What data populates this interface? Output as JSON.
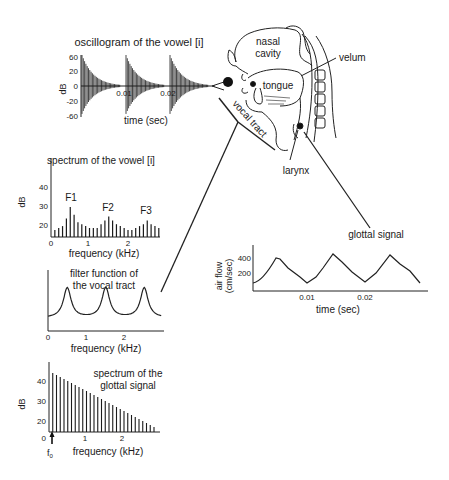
{
  "oscillogram": {
    "title": "oscillogram of the vowel [i]",
    "ylabel": "dB",
    "yticks": [
      "60",
      "20",
      "0",
      "-20",
      "-60"
    ],
    "xticks": [
      "0.01",
      "0.02"
    ],
    "xlabel": "time (sec)"
  },
  "anatomy": {
    "nasal_line1": "nasal",
    "nasal_line2": "cavity",
    "tongue": "tongue",
    "velum": "velum",
    "vocal_tract": "vocal tract",
    "larynx": "larynx"
  },
  "vowel_spectrum": {
    "title": "spectrum of the vowel [i]",
    "ylabel": "dB",
    "yticks": [
      "40",
      "30",
      "20"
    ],
    "xticks": [
      "0",
      "1",
      "2"
    ],
    "xlabel": "frequency (kHz)",
    "formants": [
      "F1",
      "F2",
      "F3"
    ]
  },
  "filter_function": {
    "title_line1": "filter function of",
    "title_line2": "the vocal tract",
    "xticks": [
      "0",
      "1",
      "2"
    ],
    "xlabel": "frequency (kHz)"
  },
  "glottal_spectrum": {
    "title_line1": "spectrum of the",
    "title_line2": "glottal signal",
    "ylabel": "dB",
    "yticks": [
      "40",
      "30",
      "20"
    ],
    "xticks": [
      "0",
      "1",
      "2"
    ],
    "xlabel": "frequency (kHz)",
    "f0_label": "f",
    "f0_sub": "0"
  },
  "glottal_signal": {
    "title": "glottal signal",
    "ylabel_line1": "air flow",
    "ylabel_line2": "(cm/sec)",
    "yticks": [
      "400",
      "200"
    ],
    "xticks": [
      "0.01",
      "0.02"
    ],
    "xlabel": "time (sec)"
  },
  "chart_data": [
    {
      "type": "line",
      "title": "oscillogram of the vowel [i]",
      "xlabel": "time (sec)",
      "ylabel": "dB",
      "ylim": [
        -60,
        60
      ],
      "xticks": [
        0.01,
        0.02
      ],
      "description": "three damped oscillation bursts starting at ~0, ~0.01, ~0.02 sec, peaking near 60 and decaying"
    },
    {
      "type": "bar",
      "title": "spectrum of the vowel [i]",
      "xlabel": "frequency (kHz)",
      "ylabel": "dB",
      "ylim": [
        15,
        45
      ],
      "xticks": [
        0,
        1,
        2
      ],
      "annotations": [
        "F1 (~0.5 kHz)",
        "F2 (~1.5 kHz)",
        "F3 (~2.5 kHz)"
      ],
      "x": [
        0.1,
        0.2,
        0.3,
        0.4,
        0.5,
        0.6,
        0.7,
        0.8,
        0.9,
        1.0,
        1.1,
        1.2,
        1.3,
        1.4,
        1.5,
        1.6,
        1.7,
        1.8,
        1.9,
        2.0,
        2.1,
        2.2,
        2.3,
        2.4,
        2.5,
        2.6,
        2.7,
        2.8
      ],
      "values": [
        19,
        20,
        21,
        25,
        31,
        27,
        23,
        22,
        21,
        20,
        20,
        20,
        22,
        24,
        26,
        24,
        22,
        21,
        20,
        19,
        19,
        20,
        21,
        22,
        24,
        22,
        21,
        20
      ]
    },
    {
      "type": "line",
      "title": "filter function of the vocal tract",
      "xlabel": "frequency (kHz)",
      "xticks": [
        0,
        1,
        2
      ],
      "peaks_khz": [
        0.5,
        1.5,
        2.5
      ]
    },
    {
      "type": "bar",
      "title": "spectrum of the glottal signal",
      "xlabel": "frequency (kHz)",
      "ylabel": "dB",
      "ylim": [
        15,
        47
      ],
      "xticks": [
        0,
        1,
        2
      ],
      "annotations": [
        "f0 (~0.1 kHz)"
      ],
      "x": [
        0.1,
        0.2,
        0.3,
        0.4,
        0.5,
        0.6,
        0.7,
        0.8,
        0.9,
        1.0,
        1.1,
        1.2,
        1.3,
        1.4,
        1.5,
        1.6,
        1.7,
        1.8,
        1.9,
        2.0,
        2.1,
        2.2,
        2.3,
        2.4,
        2.5,
        2.6,
        2.7,
        2.8
      ],
      "values": [
        44,
        43,
        42,
        41,
        40,
        39,
        38,
        37,
        36,
        35,
        34,
        33,
        32,
        31,
        30,
        29,
        28,
        27,
        26,
        25,
        24,
        23,
        22,
        21,
        20,
        19,
        18,
        17
      ]
    },
    {
      "type": "line",
      "title": "glottal signal",
      "xlabel": "time (sec)",
      "ylabel": "air flow (cm/sec)",
      "xticks": [
        0.01,
        0.02
      ],
      "x": [
        0.0,
        0.005,
        0.008,
        0.01,
        0.015,
        0.018,
        0.02,
        0.025,
        0.029
      ],
      "values": [
        80,
        400,
        240,
        70,
        430,
        220,
        70,
        430,
        90
      ]
    }
  ]
}
